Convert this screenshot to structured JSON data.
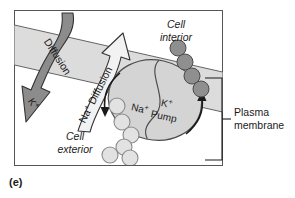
{
  "figure": {
    "caption": "(e)",
    "labels": {
      "cell_interior": [
        "Cell",
        "interior"
      ],
      "cell_exterior": [
        "Cell",
        "exterior"
      ],
      "plasma_membrane": [
        "Plasma",
        "membrane"
      ],
      "diffusion_k": "Diffusion",
      "ion_k": "K",
      "ion_k_charge": "+",
      "diffusion_na": "Diffusion",
      "ion_na": "Na",
      "ion_na_charge": "+",
      "pump_na_label": "Na",
      "pump_na_charge": "+",
      "pump_k_label": "K",
      "pump_k_charge": "+",
      "pump_word": "Pump"
    },
    "colors": {
      "background": "#ffffff",
      "frame_border": "#555555",
      "membrane_band": "#dcdcdc",
      "membrane_band_line": "#555555",
      "diffusion_arrow_fill": "#8c8c8c",
      "diffusion_arrow_stroke": "#333333",
      "na_arrow_fill": "#f2f2f2",
      "na_arrow_stroke": "#333333",
      "pump_fill": "#d4d4d4",
      "pump_stroke": "#4d4d4d",
      "k_ion_fill": "#8f8f8f",
      "k_ion_stroke": "#4a4a4a",
      "na_ion_fill": "#e2e2e2",
      "na_ion_stroke": "#8a8a8a",
      "text": "#1a1a1a"
    },
    "k_ions": [
      {
        "cx": 178,
        "cy": 48,
        "r": 8
      },
      {
        "cx": 185,
        "cy": 62,
        "r": 8
      },
      {
        "cx": 192,
        "cy": 76,
        "r": 8
      },
      {
        "cx": 201,
        "cy": 89,
        "r": 8
      }
    ],
    "na_ions": [
      {
        "cx": 117,
        "cy": 106,
        "r": 8
      },
      {
        "cx": 122,
        "cy": 122,
        "r": 8
      },
      {
        "cx": 131,
        "cy": 135,
        "r": 8
      },
      {
        "cx": 124,
        "cy": 147,
        "r": 8
      },
      {
        "cx": 110,
        "cy": 155,
        "r": 8
      },
      {
        "cx": 130,
        "cy": 158,
        "r": 8
      }
    ]
  }
}
